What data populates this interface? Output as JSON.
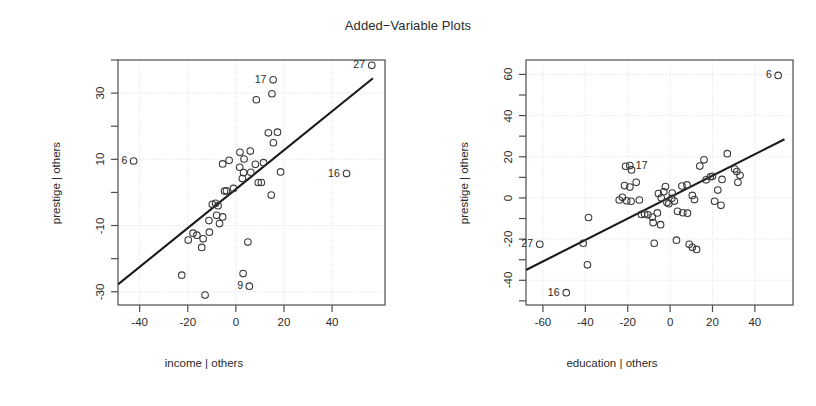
{
  "title": "Added−Variable Plots",
  "panels": [
    {
      "id": "income",
      "name": "income-panel",
      "xlabel": "income | others",
      "ylabel": "prestige | others",
      "xticks": [
        "-40",
        "-20",
        "0",
        "20",
        "40"
      ],
      "xtickvals": [
        -40,
        -20,
        0,
        20,
        40
      ],
      "yticks": [
        "30",
        "10",
        "-10",
        "-30"
      ],
      "ytickvals": [
        30,
        10,
        -10,
        -30
      ],
      "xlim": [
        -49,
        62
      ],
      "ylim": [
        -34,
        40
      ],
      "fit_line": {
        "x0": -49,
        "y0": -27.8,
        "x1": 57,
        "y1": 34.5
      },
      "labeled_points": [
        {
          "label": "6",
          "x": -42.5,
          "y": 9.5,
          "side": "right"
        },
        {
          "label": "9",
          "x": 5.6,
          "y": -28.3,
          "side": "right"
        },
        {
          "label": "16",
          "x": 46.0,
          "y": 5.7,
          "side": "right"
        },
        {
          "label": "17",
          "x": 15.5,
          "y": 34.0,
          "side": "right"
        },
        {
          "label": "27",
          "x": 56.5,
          "y": 38.4,
          "side": "right"
        }
      ],
      "points": [
        [
          -42.5,
          9.5
        ],
        [
          15.5,
          34.0
        ],
        [
          56.5,
          38.4
        ],
        [
          46.0,
          5.7
        ],
        [
          5.6,
          -28.3
        ],
        [
          8.5,
          28.0
        ],
        [
          15.0,
          29.8
        ],
        [
          13.5,
          18.0
        ],
        [
          17.3,
          18.2
        ],
        [
          15.6,
          15.0
        ],
        [
          1.7,
          12.1
        ],
        [
          6.0,
          12.5
        ],
        [
          -2.8,
          9.7
        ],
        [
          3.4,
          10.1
        ],
        [
          1.6,
          7.6
        ],
        [
          8.1,
          8.5
        ],
        [
          11.5,
          9.0
        ],
        [
          3.2,
          6.0
        ],
        [
          6.2,
          6.1
        ],
        [
          18.6,
          6.2
        ],
        [
          -5.5,
          8.6
        ],
        [
          2.7,
          4.2
        ],
        [
          9.3,
          3.0
        ],
        [
          10.6,
          3.0
        ],
        [
          -1.0,
          1.2
        ],
        [
          -4.7,
          0.4
        ],
        [
          -3.9,
          0.5
        ],
        [
          14.7,
          -0.8
        ],
        [
          -8.4,
          -3.3
        ],
        [
          -9.8,
          -3.6
        ],
        [
          -7.4,
          -4.0
        ],
        [
          -8.0,
          -6.9
        ],
        [
          -5.5,
          -7.4
        ],
        [
          -11.2,
          -8.5
        ],
        [
          -6.8,
          -9.4
        ],
        [
          -17.8,
          -12.3
        ],
        [
          -16.2,
          -12.9
        ],
        [
          -19.8,
          -14.4
        ],
        [
          -11.0,
          -12.0
        ],
        [
          -13.6,
          -14.0
        ],
        [
          -14.2,
          -16.6
        ],
        [
          5.0,
          -15.0
        ],
        [
          3.0,
          -24.5
        ],
        [
          -22.5,
          -25.0
        ],
        [
          -12.8,
          -31.0
        ]
      ]
    },
    {
      "id": "education",
      "name": "education-panel",
      "xlabel": "education | others",
      "ylabel": "prestige | others",
      "xticks": [
        "-60",
        "-40",
        "-20",
        "0",
        "20",
        "40"
      ],
      "xtickvals": [
        -60,
        -40,
        -20,
        0,
        20,
        40
      ],
      "yticks": [
        "60",
        "40",
        "20",
        "0",
        "-20",
        "-40"
      ],
      "ytickvals": [
        60,
        40,
        20,
        0,
        -20,
        -40
      ],
      "xlim": [
        -68,
        58
      ],
      "ylim": [
        -52,
        67
      ],
      "fit_line": {
        "x0": -68,
        "y0": -35.0,
        "x1": 54,
        "y1": 28.5
      },
      "labeled_points": [
        {
          "label": "27",
          "x": -61.5,
          "y": -22.5,
          "side": "right"
        },
        {
          "label": "16",
          "x": -49.0,
          "y": -46.0,
          "side": "right"
        },
        {
          "label": "17",
          "x": -19.0,
          "y": 15.7,
          "side": "left"
        },
        {
          "label": "6",
          "x": 51.0,
          "y": 59.5,
          "side": "right"
        }
      ],
      "points": [
        [
          -61.5,
          -22.5
        ],
        [
          -49.0,
          -46.0
        ],
        [
          51.0,
          59.5
        ],
        [
          -19.0,
          15.7
        ],
        [
          -21.0,
          15.4
        ],
        [
          -18.2,
          13.6
        ],
        [
          -38.5,
          -9.5
        ],
        [
          -41.0,
          -22.0
        ],
        [
          -39.0,
          -32.5
        ],
        [
          -22.5,
          0.3
        ],
        [
          -24.0,
          -1.0
        ],
        [
          -20.5,
          -1.4
        ],
        [
          -18.4,
          -1.6
        ],
        [
          -21.5,
          6.0
        ],
        [
          -19.0,
          5.3
        ],
        [
          -16.0,
          7.6
        ],
        [
          -14.5,
          -1.0
        ],
        [
          -12.0,
          -7.8
        ],
        [
          -10.5,
          -8.2
        ],
        [
          -13.5,
          -8.0
        ],
        [
          -8.4,
          -9.3
        ],
        [
          -6.0,
          -7.3
        ],
        [
          -8.0,
          -12.0
        ],
        [
          -4.5,
          -13.0
        ],
        [
          -5.5,
          2.1
        ],
        [
          -3.0,
          3.0
        ],
        [
          -2.2,
          5.5
        ],
        [
          -4.2,
          0.1
        ],
        [
          -1.5,
          -2.2
        ],
        [
          -0.6,
          -2.8
        ],
        [
          0.8,
          -0.2
        ],
        [
          1.0,
          2.4
        ],
        [
          2.0,
          -1.5
        ],
        [
          3.5,
          -6.5
        ],
        [
          6.0,
          -7.2
        ],
        [
          8.2,
          -7.4
        ],
        [
          5.6,
          5.8
        ],
        [
          8.0,
          6.3
        ],
        [
          10.5,
          1.2
        ],
        [
          11.5,
          -0.8
        ],
        [
          -7.5,
          -22.0
        ],
        [
          3.0,
          -20.5
        ],
        [
          9.0,
          -22.5
        ],
        [
          10.5,
          -24.0
        ],
        [
          12.5,
          -25.0
        ],
        [
          14.0,
          15.5
        ],
        [
          16.0,
          18.5
        ],
        [
          19.0,
          10.3
        ],
        [
          20.0,
          10.5
        ],
        [
          22.5,
          3.8
        ],
        [
          24.0,
          -3.6
        ],
        [
          27.0,
          21.5
        ],
        [
          30.5,
          14.0
        ],
        [
          31.5,
          12.8
        ],
        [
          33.0,
          11.0
        ],
        [
          32.0,
          7.6
        ],
        [
          17.0,
          8.8
        ],
        [
          21.0,
          -1.6
        ],
        [
          24.5,
          9.0
        ]
      ]
    }
  ],
  "geometry": {
    "panel_width": 408,
    "plot_left": 118,
    "plot_right": 385,
    "plot_top": 60,
    "plot_bottom": 305
  },
  "colors": {
    "axis": "#4d4d4d",
    "grid": "#d9d9e0",
    "point": "#3a3a3a",
    "line": "#1a1a1a",
    "text": "#2b2b2b",
    "background": "#ffffff"
  }
}
